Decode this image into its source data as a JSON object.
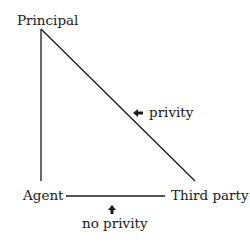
{
  "diagram": {
    "nodes": {
      "principal": "Principal",
      "agent": "Agent",
      "third_party": "Third party"
    },
    "annotations": {
      "privity": "privity",
      "no_privity": "no privity"
    },
    "edges": [
      {
        "from": "Principal",
        "to": "Agent"
      },
      {
        "from": "Principal",
        "to": "Third party",
        "label": "privity"
      },
      {
        "from": "Agent",
        "to": "Third party",
        "label": "no privity"
      }
    ],
    "colors": {
      "line": "#1a1a1a",
      "background": "#ffffff"
    }
  }
}
